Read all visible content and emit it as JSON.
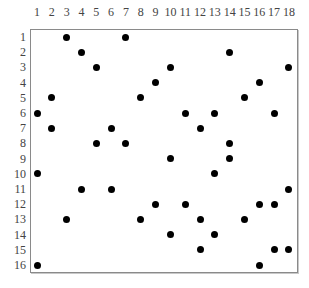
{
  "diagram": {
    "type": "dot-grid",
    "columns": [
      "1",
      "2",
      "3",
      "4",
      "5",
      "6",
      "7",
      "8",
      "9",
      "10",
      "11",
      "12",
      "13",
      "14",
      "15",
      "16",
      "17",
      "18"
    ],
    "rows": [
      "1",
      "2",
      "3",
      "4",
      "5",
      "6",
      "7",
      "8",
      "9",
      "10",
      "11",
      "12",
      "13",
      "14",
      "15",
      "16"
    ],
    "dot_color": "#000000",
    "frame_color": "#8a8a8a",
    "dots_by_row": [
      {
        "row": 1,
        "cols": [
          3,
          7
        ]
      },
      {
        "row": 2,
        "cols": [
          4,
          14
        ]
      },
      {
        "row": 3,
        "cols": [
          5,
          10,
          18
        ]
      },
      {
        "row": 4,
        "cols": [
          9,
          16
        ]
      },
      {
        "row": 5,
        "cols": [
          2,
          8,
          15
        ]
      },
      {
        "row": 6,
        "cols": [
          1,
          11,
          13,
          17
        ]
      },
      {
        "row": 7,
        "cols": [
          2,
          6,
          12
        ]
      },
      {
        "row": 8,
        "cols": [
          5,
          7,
          14
        ]
      },
      {
        "row": 9,
        "cols": [
          10,
          14
        ]
      },
      {
        "row": 10,
        "cols": [
          1,
          13
        ]
      },
      {
        "row": 11,
        "cols": [
          4,
          6,
          18
        ]
      },
      {
        "row": 12,
        "cols": [
          9,
          11,
          16,
          17
        ]
      },
      {
        "row": 13,
        "cols": [
          3,
          8,
          12,
          15
        ]
      },
      {
        "row": 14,
        "cols": [
          10,
          13
        ]
      },
      {
        "row": 15,
        "cols": [
          12,
          17,
          18
        ]
      },
      {
        "row": 16,
        "cols": [
          1,
          16
        ]
      }
    ]
  },
  "layout": {
    "col_x0": 37,
    "col_step": 14.82,
    "row_y0": 37,
    "row_step": 15.2
  }
}
